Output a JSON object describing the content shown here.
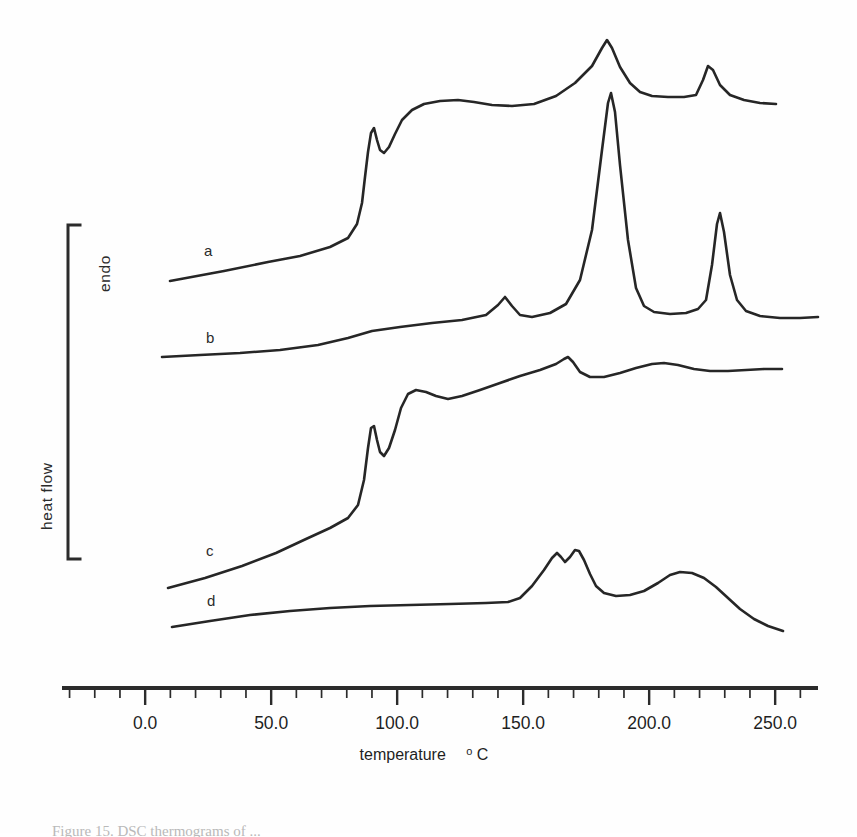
{
  "figure": {
    "kind": "dsc-thermogram",
    "background_color": "#fefefe",
    "ink_color": "#262626",
    "caption_partial": "Figure 15.  DSC thermograms of ..."
  },
  "axes": {
    "x": {
      "label_main": "temperature",
      "label_unit_sup": "o",
      "label_unit": "C",
      "tick_labels": [
        "0.0",
        "50.0",
        "100.0",
        "150.0",
        "200.0",
        "250.0"
      ],
      "tick_values": [
        0,
        50,
        100,
        150,
        200,
        250
      ],
      "minor_tick_step": 10,
      "range": [
        -33,
        267
      ],
      "line_px": {
        "x1": 62,
        "x2": 818,
        "y": 688
      }
    },
    "y": {
      "bracket_label_top": "endo",
      "bracket_label_side": "heat flow",
      "bracket_px": {
        "x": 68,
        "y_top": 224,
        "y_bottom": 560
      }
    }
  },
  "curves": [
    {
      "id": "a",
      "label": "a",
      "label_px": {
        "x": 204,
        "y": 256
      },
      "description": "gradual rise, sharp glass-transition step near 90 C with small endotherm notch, plateau, large sharp melting peak at ~183 C, smaller peak at ~222 C",
      "features": [
        {
          "type": "step",
          "temperature_c": 90,
          "label": "glass transition / notch"
        },
        {
          "type": "peak",
          "temperature_c": 183,
          "label": "major melting endotherm"
        },
        {
          "type": "peak",
          "temperature_c": 222,
          "label": "secondary endotherm"
        }
      ],
      "path": "M 170 281 L 224 271 L 268 262 L 300 256 L 330 247 L 348 238 L 357 224 L 362 203 L 365 177 L 368 152 L 371 133 L 374 128 L 377 140 L 380 150 L 384 153 L 389 147 L 395 134 L 402 120 L 412 110 L 424 104 L 440 101 L 458 100 L 474 102 L 492 105 L 512 106 L 534 104 L 556 96 L 575 83 L 592 66 L 602 48 L 607 40 L 612 48 L 620 67 L 630 83 L 640 92 L 652 96 L 668 97 L 684 97 L 696 95 L 703 80 L 708 66 L 713 70 L 720 85 L 730 95 L 744 100 L 760 103 L 776 104"
    },
    {
      "id": "b",
      "label": "b",
      "label_px": {
        "x": 206,
        "y": 343
      },
      "description": "flat baseline, small endotherm near 145 C, very tall sharp peak at ~183 C, sharp peak at ~226 C",
      "features": [
        {
          "type": "peak",
          "temperature_c": 145,
          "label": "small endotherm"
        },
        {
          "type": "peak",
          "temperature_c": 183,
          "label": "dominant sharp endotherm"
        },
        {
          "type": "peak",
          "temperature_c": 226,
          "label": "secondary sharp endotherm"
        }
      ],
      "path": "M 162 357 L 200 355 L 240 353 L 280 350 L 318 345 L 348 338 L 372 331 L 400 327 L 432 323 L 462 320 L 486 315 L 498 305 L 505 297 L 512 306 L 520 315 L 532 317 L 550 313 L 566 304 L 580 280 L 592 230 L 602 150 L 608 103 L 611 93 L 615 112 L 620 165 L 628 240 L 636 288 L 644 306 L 654 312 L 670 314 L 686 313 L 698 309 L 706 300 L 712 265 L 717 224 L 720 213 L 724 232 L 730 275 L 737 300 L 746 311 L 760 316 L 780 318 L 800 318 L 818 317"
    },
    {
      "id": "c",
      "label": "c",
      "label_px": {
        "x": 206,
        "y": 556
      },
      "description": "gradual rise, glass-transition step with notch near 90 C, rounded peak at ~103 C, broad shallow bumps at ~170 C and ~195 C",
      "features": [
        {
          "type": "step",
          "temperature_c": 90,
          "label": "glass transition / notch"
        },
        {
          "type": "peak",
          "temperature_c": 103,
          "label": "rounded endotherm"
        },
        {
          "type": "peak",
          "temperature_c": 170,
          "label": "broad shallow endotherm"
        },
        {
          "type": "peak",
          "temperature_c": 196,
          "label": "broad shallow endotherm"
        }
      ],
      "path": "M 168 588 L 205 578 L 242 566 L 276 553 L 306 539 L 330 528 L 348 518 L 358 505 L 364 480 L 368 448 L 371 428 L 374 426 L 377 440 L 380 452 L 384 456 L 389 448 L 395 430 L 401 408 L 408 394 L 416 390 L 426 392 L 436 396 L 448 399 L 462 396 L 480 390 L 500 383 L 520 376 L 540 370 L 556 364 L 564 359 L 568 357 L 573 362 L 580 372 L 590 377 L 604 377 L 620 373 L 636 368 L 652 364 L 664 363 L 678 365 L 694 369 L 710 371 L 728 371 L 746 370 L 764 369 L 782 369"
    },
    {
      "id": "d",
      "label": "d",
      "label_px": {
        "x": 207,
        "y": 606
      },
      "description": "flat baseline to ~140 C, then double peak near 165-170 C and a broad peak near 208 C, falling at high temperature",
      "features": [
        {
          "type": "peak",
          "temperature_c": 165,
          "label": "double peak (first maximum)"
        },
        {
          "type": "peak",
          "temperature_c": 170,
          "label": "double peak (second maximum)"
        },
        {
          "type": "peak",
          "temperature_c": 208,
          "label": "broad endotherm"
        }
      ],
      "path": "M 172 627 L 210 621 L 250 615 L 290 611 L 330 608 L 370 606 L 410 605 L 450 604 L 486 603 L 508 602 L 520 598 L 532 586 L 544 570 L 552 558 L 557 553 L 561 557 L 565 562 L 570 557 L 575 550 L 579 551 L 584 560 L 590 574 L 596 586 L 604 593 L 616 596 L 630 595 L 644 591 L 658 583 L 670 575 L 680 572 L 692 573 L 704 578 L 716 587 L 728 598 L 740 609 L 754 619 L 768 626 L 783 631"
    }
  ]
}
